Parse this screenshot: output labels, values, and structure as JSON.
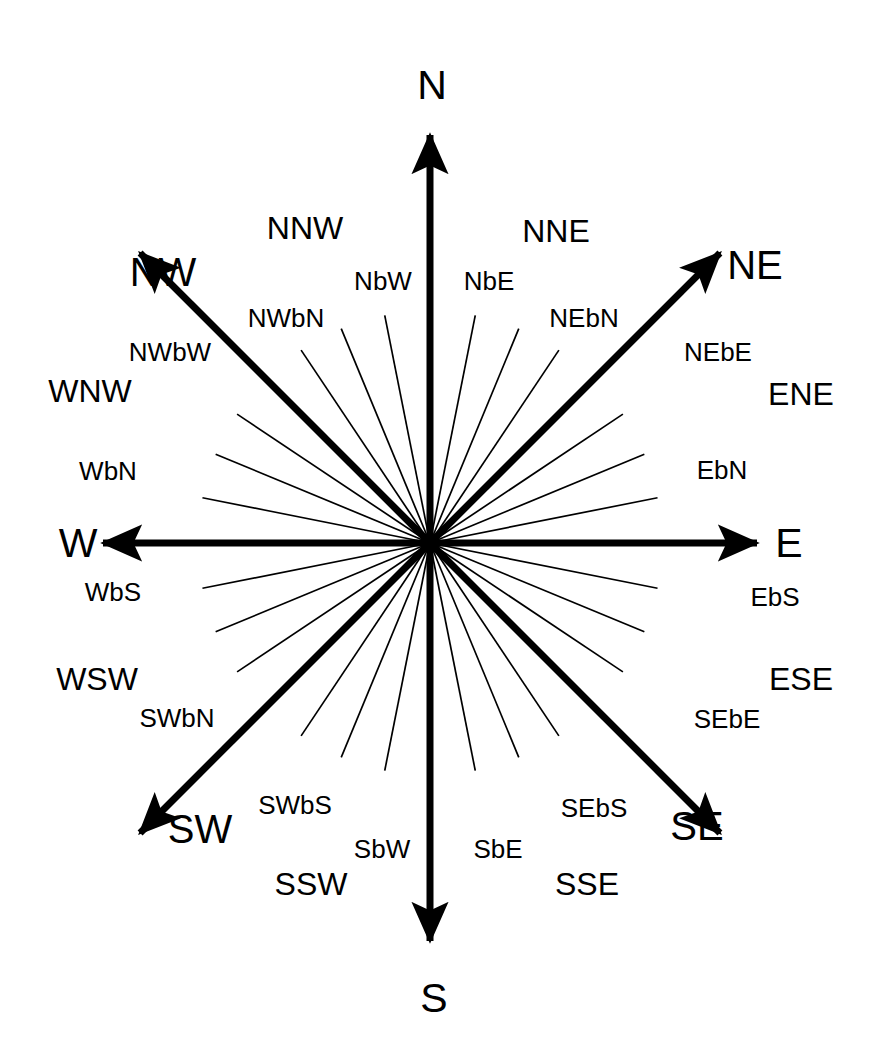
{
  "figure": {
    "background_color": "#ffffff",
    "stroke_color": "#000000",
    "center": {
      "x": 430,
      "y": 543
    }
  },
  "chart_data": {
    "type": "diagram",
    "center": {
      "x": 430,
      "y": 543
    },
    "grid": false,
    "legend": null,
    "points": [
      {
        "label": "N",
        "bearing_deg": 0,
        "tier": "cardinal",
        "style": "arrow-thick",
        "length": 408,
        "label_x": 432,
        "label_y": 85
      },
      {
        "label": "NbE",
        "bearing_deg": 11.25,
        "tier": "by",
        "style": "line-thin",
        "length": 232,
        "label_x": 489,
        "label_y": 281
      },
      {
        "label": "NNE",
        "bearing_deg": 22.5,
        "tier": "secondary",
        "style": "line-thin",
        "length": 232,
        "label_x": 556,
        "label_y": 231
      },
      {
        "label": "NEbN",
        "bearing_deg": 33.75,
        "tier": "by",
        "style": "line-thin",
        "length": 232,
        "label_x": 584,
        "label_y": 318
      },
      {
        "label": "NE",
        "bearing_deg": 45,
        "tier": "ordinal",
        "style": "arrow-thick",
        "length": 410,
        "label_x": 755,
        "label_y": 265
      },
      {
        "label": "NEbE",
        "bearing_deg": 56.25,
        "tier": "by",
        "style": "line-thin",
        "length": 232,
        "label_x": 718,
        "label_y": 352
      },
      {
        "label": "ENE",
        "bearing_deg": 67.5,
        "tier": "secondary",
        "style": "line-thin",
        "length": 232,
        "label_x": 801,
        "label_y": 394
      },
      {
        "label": "EbN",
        "bearing_deg": 78.75,
        "tier": "by",
        "style": "line-thin",
        "length": 232,
        "label_x": 722,
        "label_y": 470
      },
      {
        "label": "E",
        "bearing_deg": 90,
        "tier": "cardinal",
        "style": "arrow-thick",
        "length": 327,
        "label_x": 789,
        "label_y": 543
      },
      {
        "label": "EbS",
        "bearing_deg": 101.25,
        "tier": "by",
        "style": "line-thin",
        "length": 232,
        "label_x": 775,
        "label_y": 597
      },
      {
        "label": "ESE",
        "bearing_deg": 112.5,
        "tier": "secondary",
        "style": "line-thin",
        "length": 232,
        "label_x": 801,
        "label_y": 679
      },
      {
        "label": "SEbE",
        "bearing_deg": 123.75,
        "tier": "by",
        "style": "line-thin",
        "length": 232,
        "label_x": 727,
        "label_y": 719
      },
      {
        "label": "SE",
        "bearing_deg": 135,
        "tier": "ordinal",
        "style": "arrow-thick",
        "length": 410,
        "label_x": 697,
        "label_y": 826
      },
      {
        "label": "SEbS",
        "bearing_deg": 146.25,
        "tier": "by",
        "style": "line-thin",
        "length": 232,
        "label_x": 594,
        "label_y": 808
      },
      {
        "label": "SSE",
        "bearing_deg": 157.5,
        "tier": "secondary",
        "style": "line-thin",
        "length": 232,
        "label_x": 587,
        "label_y": 884
      },
      {
        "label": "SbE",
        "bearing_deg": 168.75,
        "tier": "by",
        "style": "line-thin",
        "length": 232,
        "label_x": 498,
        "label_y": 849
      },
      {
        "label": "S",
        "bearing_deg": 180,
        "tier": "cardinal",
        "style": "arrow-thick",
        "length": 398,
        "label_x": 434,
        "label_y": 998
      },
      {
        "label": "SbW",
        "bearing_deg": 191.25,
        "tier": "by",
        "style": "line-thin",
        "length": 232,
        "label_x": 382,
        "label_y": 849
      },
      {
        "label": "SSW",
        "bearing_deg": 202.5,
        "tier": "secondary",
        "style": "line-thin",
        "length": 232,
        "label_x": 311,
        "label_y": 884
      },
      {
        "label": "SWbS",
        "bearing_deg": 213.75,
        "tier": "by",
        "style": "line-thin",
        "length": 232,
        "label_x": 295,
        "label_y": 805
      },
      {
        "label": "SW",
        "bearing_deg": 225,
        "tier": "ordinal",
        "style": "arrow-thick",
        "length": 410,
        "label_x": 200,
        "label_y": 829
      },
      {
        "label": "SWbN",
        "bearing_deg": 236.25,
        "tier": "by",
        "style": "line-thin",
        "length": 232,
        "label_x": 177,
        "label_y": 718
      },
      {
        "label": "WSW",
        "bearing_deg": 247.5,
        "tier": "secondary",
        "style": "line-thin",
        "length": 232,
        "label_x": 97,
        "label_y": 679
      },
      {
        "label": "WbS",
        "bearing_deg": 258.75,
        "tier": "by",
        "style": "line-thin",
        "length": 232,
        "label_x": 113,
        "label_y": 592
      },
      {
        "label": "W",
        "bearing_deg": 270,
        "tier": "cardinal",
        "style": "arrow-thick",
        "length": 327,
        "label_x": 78,
        "label_y": 543
      },
      {
        "label": "WbN",
        "bearing_deg": 281.25,
        "tier": "by",
        "style": "line-thin",
        "length": 232,
        "label_x": 108,
        "label_y": 471
      },
      {
        "label": "WNW",
        "bearing_deg": 292.5,
        "tier": "secondary",
        "style": "line-thin",
        "length": 232,
        "label_x": 90,
        "label_y": 391
      },
      {
        "label": "NWbW",
        "bearing_deg": 303.75,
        "tier": "by",
        "style": "line-thin",
        "length": 232,
        "label_x": 170,
        "label_y": 352
      },
      {
        "label": "NW",
        "bearing_deg": 315,
        "tier": "ordinal",
        "style": "arrow-thick",
        "length": 410,
        "label_x": 163,
        "label_y": 272
      },
      {
        "label": "NWbN",
        "bearing_deg": 326.25,
        "tier": "by",
        "style": "line-thin",
        "length": 232,
        "label_x": 286,
        "label_y": 318
      },
      {
        "label": "NNW",
        "bearing_deg": 337.5,
        "tier": "secondary",
        "style": "line-thin",
        "length": 232,
        "label_x": 305,
        "label_y": 228
      },
      {
        "label": "NbW",
        "bearing_deg": 348.75,
        "tier": "by",
        "style": "line-thin",
        "length": 232,
        "label_x": 383,
        "label_y": 281
      }
    ]
  }
}
